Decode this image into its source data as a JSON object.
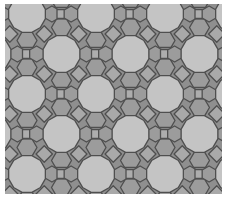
{
  "canvas": {
    "width": 226,
    "height": 202,
    "frame_color": "#ffffff",
    "frame": {
      "x": 5,
      "y": 4,
      "width": 217,
      "height": 190
    }
  },
  "tiling": {
    "name": "truncated-trihexagonal-4-6-12-pattern",
    "background_color": "#8f8f8f",
    "outline_color": "#4f4f4f",
    "outline_width": 1.3,
    "dodecagon": {
      "fill": "#c4c4c4",
      "radius": 19,
      "vertex_angle_offset": 15
    },
    "hexagon_vertical_chain": {
      "fill": "#9c9c9c",
      "radius": 10,
      "vertex_angle_offset": 0,
      "offsets_y": [
        26.5,
        53.5
      ]
    },
    "square_vertical_chain": {
      "fill": "#adadad",
      "radius": 9.19,
      "vertex_angle_offset": 45,
      "offset_y": 40
    },
    "hexagon_horizontal_chain": {
      "fill": "#9c9c9c",
      "radius": 8,
      "vertex_angle_offset": 30,
      "offsets_x": [
        24.9,
        44.1
      ]
    },
    "square_horizontal_chain": {
      "fill": "#adadad",
      "radius": 6.36,
      "vertex_angle_offset": 45,
      "offset_x": 34.5
    },
    "diamond_diagonal": {
      "fill": "#a9a9a9",
      "radius": 8.2,
      "vertex_angle_offset": 0,
      "offset_x": 17.25,
      "offset_y": 20
    },
    "lattice": {
      "first_row_y": 14,
      "row_spacing": 40,
      "column_spacing": 69,
      "even_row_x": 27,
      "odd_row_x": 61.5,
      "rows_from": -2,
      "rows_to": 6,
      "cols_from": -2,
      "cols_to": 4
    }
  }
}
